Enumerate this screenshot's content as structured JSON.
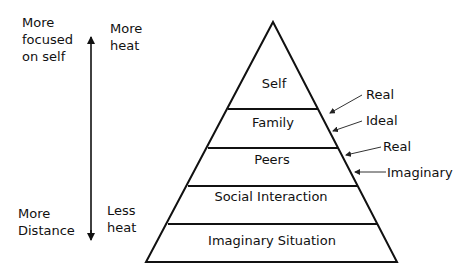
{
  "left_axis": {
    "top_label": [
      "More",
      "focused",
      "on self"
    ],
    "bottom_label": [
      "More",
      "Distance"
    ]
  },
  "heat_axis": {
    "top_label": [
      "More",
      "heat"
    ],
    "bottom_label": [
      "Less",
      "heat"
    ]
  },
  "pyramid": {
    "layers": [
      {
        "label": "Self"
      },
      {
        "label": "Family"
      },
      {
        "label": "Peers"
      },
      {
        "label": "Social Interaction"
      },
      {
        "label": "Imaginary Situation"
      }
    ]
  },
  "annotations": [
    {
      "label": "Real"
    },
    {
      "label": "Ideal"
    },
    {
      "label": "Real"
    },
    {
      "label": "Imaginary"
    }
  ],
  "colors": {
    "line": "#111111",
    "background": "#ffffff"
  }
}
